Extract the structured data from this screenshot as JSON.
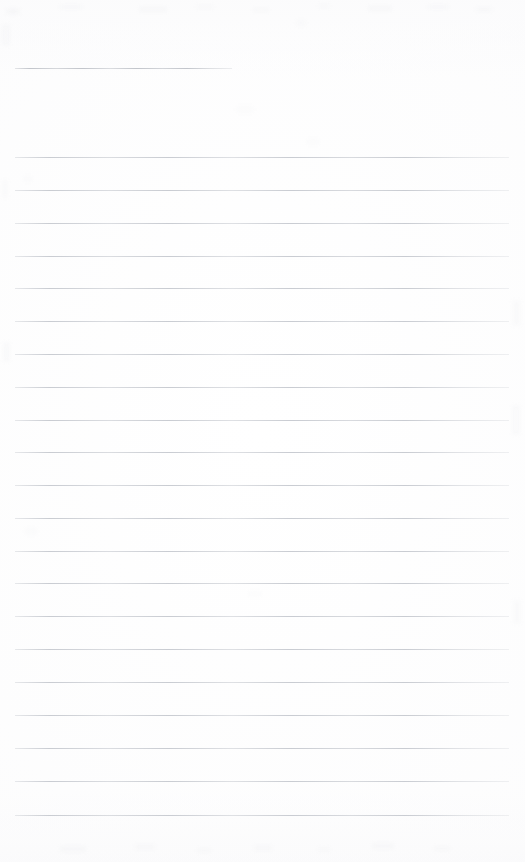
{
  "document": {
    "kind": "blank-lined-paper-scan",
    "page_width": 525,
    "page_height": 862,
    "background_color": "#ffffff",
    "rule_color": "#c9ccd2",
    "header_rule_color": "#c2c5cb",
    "visible_text": "",
    "note": ""
  },
  "layout": {
    "left_margin_x": 15,
    "right_edge_x": 509,
    "rule_thickness": 1,
    "rule_spacing": 32.7,
    "first_body_rule_y": 157,
    "last_body_rule_y": 815,
    "bottom_margin": 47
  },
  "header_rule": {
    "label": "header-rule",
    "x": 15,
    "y": 68,
    "width": 217,
    "value": ""
  },
  "body_rules": [
    {
      "index": 1,
      "y": 157,
      "x": 15,
      "width": 494,
      "value": ""
    },
    {
      "index": 2,
      "y": 190,
      "x": 15,
      "width": 494,
      "value": ""
    },
    {
      "index": 3,
      "y": 223,
      "x": 15,
      "width": 494,
      "value": ""
    },
    {
      "index": 4,
      "y": 256,
      "x": 15,
      "width": 494,
      "value": ""
    },
    {
      "index": 5,
      "y": 288,
      "x": 15,
      "width": 494,
      "value": ""
    },
    {
      "index": 6,
      "y": 321,
      "x": 15,
      "width": 494,
      "value": ""
    },
    {
      "index": 7,
      "y": 354,
      "x": 15,
      "width": 494,
      "value": ""
    },
    {
      "index": 8,
      "y": 387,
      "x": 15,
      "width": 494,
      "value": ""
    },
    {
      "index": 9,
      "y": 420,
      "x": 15,
      "width": 494,
      "value": ""
    },
    {
      "index": 10,
      "y": 452,
      "x": 15,
      "width": 494,
      "value": ""
    },
    {
      "index": 11,
      "y": 485,
      "x": 15,
      "width": 494,
      "value": ""
    },
    {
      "index": 12,
      "y": 518,
      "x": 15,
      "width": 494,
      "value": ""
    },
    {
      "index": 13,
      "y": 551,
      "x": 15,
      "width": 494,
      "value": ""
    },
    {
      "index": 14,
      "y": 583,
      "x": 15,
      "width": 494,
      "value": ""
    },
    {
      "index": 15,
      "y": 616,
      "x": 15,
      "width": 494,
      "value": ""
    },
    {
      "index": 16,
      "y": 649,
      "x": 15,
      "width": 494,
      "value": ""
    },
    {
      "index": 17,
      "y": 682,
      "x": 15,
      "width": 494,
      "value": ""
    },
    {
      "index": 18,
      "y": 715,
      "x": 15,
      "width": 494,
      "value": ""
    },
    {
      "index": 19,
      "y": 748,
      "x": 15,
      "width": 494,
      "value": ""
    },
    {
      "index": 20,
      "y": 781,
      "x": 15,
      "width": 494,
      "value": ""
    },
    {
      "index": 21,
      "y": 815,
      "x": 15,
      "width": 494,
      "value": ""
    }
  ],
  "speckles": [
    {
      "x": 6,
      "y": 9,
      "w": 14,
      "h": 5,
      "o": 0.16
    },
    {
      "x": 60,
      "y": 5,
      "w": 22,
      "h": 4,
      "o": 0.12
    },
    {
      "x": 139,
      "y": 7,
      "w": 28,
      "h": 5,
      "o": 0.13
    },
    {
      "x": 196,
      "y": 5,
      "w": 18,
      "h": 4,
      "o": 0.1
    },
    {
      "x": 253,
      "y": 8,
      "w": 16,
      "h": 4,
      "o": 0.11
    },
    {
      "x": 318,
      "y": 4,
      "w": 12,
      "h": 4,
      "o": 0.1
    },
    {
      "x": 368,
      "y": 6,
      "w": 24,
      "h": 5,
      "o": 0.13
    },
    {
      "x": 428,
      "y": 5,
      "w": 20,
      "h": 4,
      "o": 0.12
    },
    {
      "x": 476,
      "y": 7,
      "w": 16,
      "h": 5,
      "o": 0.11
    },
    {
      "x": 2,
      "y": 24,
      "w": 8,
      "h": 22,
      "o": 0.1
    },
    {
      "x": 296,
      "y": 20,
      "w": 10,
      "h": 6,
      "o": 0.08
    },
    {
      "x": 236,
      "y": 106,
      "w": 18,
      "h": 7,
      "o": 0.07
    },
    {
      "x": 306,
      "y": 139,
      "w": 14,
      "h": 6,
      "o": 0.07
    },
    {
      "x": 2,
      "y": 180,
      "w": 6,
      "h": 18,
      "o": 0.09
    },
    {
      "x": 23,
      "y": 176,
      "w": 10,
      "h": 6,
      "o": 0.07
    },
    {
      "x": 3,
      "y": 342,
      "w": 7,
      "h": 20,
      "o": 0.1
    },
    {
      "x": 512,
      "y": 300,
      "w": 9,
      "h": 26,
      "o": 0.09
    },
    {
      "x": 512,
      "y": 405,
      "w": 8,
      "h": 30,
      "o": 0.1
    },
    {
      "x": 25,
      "y": 528,
      "w": 12,
      "h": 7,
      "o": 0.08
    },
    {
      "x": 248,
      "y": 591,
      "w": 14,
      "h": 6,
      "o": 0.07
    },
    {
      "x": 513,
      "y": 600,
      "w": 8,
      "h": 24,
      "o": 0.09
    },
    {
      "x": 60,
      "y": 846,
      "w": 26,
      "h": 6,
      "o": 0.12
    },
    {
      "x": 135,
      "y": 844,
      "w": 20,
      "h": 6,
      "o": 0.11
    },
    {
      "x": 197,
      "y": 848,
      "w": 14,
      "h": 5,
      "o": 0.1
    },
    {
      "x": 254,
      "y": 845,
      "w": 18,
      "h": 6,
      "o": 0.11
    },
    {
      "x": 318,
      "y": 847,
      "w": 12,
      "h": 5,
      "o": 0.09
    },
    {
      "x": 372,
      "y": 843,
      "w": 22,
      "h": 6,
      "o": 0.12
    },
    {
      "x": 434,
      "y": 846,
      "w": 16,
      "h": 5,
      "o": 0.1
    }
  ]
}
